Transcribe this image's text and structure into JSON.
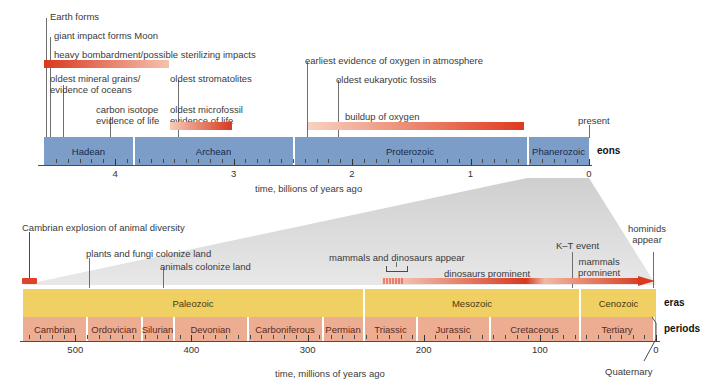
{
  "figure": {
    "colors": {
      "eon_bar": "#7d9dc9",
      "era_bar": "#f0cf63",
      "period_bar": "#edad93",
      "event_red": "#e0412a",
      "funnel_gray": "#d5d5d5",
      "text": "#3a3a3a"
    }
  },
  "top": {
    "axis": {
      "label": "time, billions of years ago",
      "ticks": [
        "4",
        "3",
        "2",
        "1",
        "0"
      ],
      "tick_values": [
        4,
        3,
        2,
        1,
        0
      ],
      "range": [
        4.6,
        0
      ],
      "minor_tick_step": 0.1
    },
    "row_label": "eons",
    "eons": [
      {
        "name": "Hadean",
        "start": 4.6,
        "end": 3.85
      },
      {
        "name": "Archean",
        "start": 3.85,
        "end": 2.5
      },
      {
        "name": "Proterozoic",
        "start": 2.5,
        "end": 0.541
      },
      {
        "name": "Phanerozoic",
        "start": 0.541,
        "end": 0
      }
    ],
    "events": [
      {
        "label": "Earth forms",
        "kind": "line"
      },
      {
        "label": "giant impact forms Moon",
        "kind": "line"
      },
      {
        "label": "heavy bombardment/possible sterilizing impacts",
        "kind": "bar"
      },
      {
        "label": "oldest mineral grains/\nevidence of oceans",
        "kind": "line"
      },
      {
        "label": "carbon isotope\nevidence of life",
        "kind": "line"
      },
      {
        "label": "oldest stromatolites",
        "kind": "line"
      },
      {
        "label": "oldest microfossil\nevidence of life",
        "kind": "bar"
      },
      {
        "label": "earliest evidence of oxygen in atmosphere",
        "kind": "line"
      },
      {
        "label": "oldest eukaryotic fossils",
        "kind": "line"
      },
      {
        "label": "buildup of oxygen",
        "kind": "bar"
      },
      {
        "label": "present",
        "kind": "line"
      }
    ]
  },
  "bottom": {
    "axis": {
      "label": "time, millions of years ago",
      "ticks": [
        "500",
        "400",
        "300",
        "200",
        "100",
        "0"
      ],
      "tick_values": [
        500,
        400,
        300,
        200,
        100,
        0
      ],
      "range": [
        545,
        0
      ],
      "minor_tick_step": 10
    },
    "era_row_label": "eras",
    "period_row_label": "periods",
    "eras": [
      {
        "name": "Paleozoic",
        "start": 545,
        "end": 251
      },
      {
        "name": "Mesozoic",
        "start": 251,
        "end": 65
      },
      {
        "name": "Cenozoic",
        "start": 65,
        "end": 0
      }
    ],
    "periods": [
      {
        "name": "Cambrian",
        "start": 545,
        "end": 490
      },
      {
        "name": "Ordovician",
        "start": 490,
        "end": 443
      },
      {
        "name": "Silurian",
        "start": 443,
        "end": 417
      },
      {
        "name": "Devonian",
        "start": 417,
        "end": 354
      },
      {
        "name": "Carboniferous",
        "start": 354,
        "end": 290
      },
      {
        "name": "Permian",
        "start": 290,
        "end": 251
      },
      {
        "name": "Triassic",
        "start": 251,
        "end": 206
      },
      {
        "name": "Jurassic",
        "start": 206,
        "end": 144
      },
      {
        "name": "Cretaceous",
        "start": 144,
        "end": 65
      },
      {
        "name": "Tertiary",
        "start": 65,
        "end": 1.8
      },
      {
        "name": "Quaternary",
        "start": 1.8,
        "end": 0
      }
    ],
    "quaternary_callout": "Quaternary",
    "events": [
      {
        "label": "Cambrian explosion of animal diversity",
        "kind": "block"
      },
      {
        "label": "plants and fungi colonize land",
        "kind": "line"
      },
      {
        "label": "animals colonize land",
        "kind": "line"
      },
      {
        "label": "mammals and dinosaurs appear",
        "kind": "bracket"
      },
      {
        "label": "dinosaurs prominent",
        "kind": "bar"
      },
      {
        "label": "K–T event",
        "kind": "line"
      },
      {
        "label": "mammals\nprominent",
        "kind": "bar"
      },
      {
        "label": "hominids\nappear",
        "kind": "line"
      }
    ]
  }
}
